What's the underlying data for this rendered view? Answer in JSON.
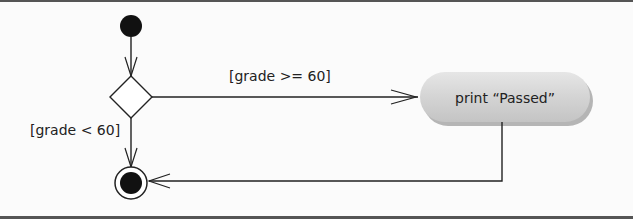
{
  "diagram": {
    "type": "uml-activity-diagram",
    "colors": {
      "frame": "#555555",
      "background": "#fbfbfb",
      "line": "#222222",
      "node_fill": "#111111",
      "action_fill": "#d6d6d6",
      "action_shadow": "#b5b5b5"
    },
    "nodes": {
      "initial": {
        "kind": "initial-node"
      },
      "decision": {
        "kind": "decision-node"
      },
      "action": {
        "kind": "action-state",
        "label": "print “Passed”"
      },
      "final": {
        "kind": "final-node"
      }
    },
    "guards": {
      "pass": "[grade >= 60]",
      "fail": "[grade < 60]"
    },
    "transitions": [
      {
        "from": "initial",
        "to": "decision",
        "guard": ""
      },
      {
        "from": "decision",
        "to": "action",
        "guard": "[grade >= 60]"
      },
      {
        "from": "decision",
        "to": "final",
        "guard": "[grade < 60]"
      },
      {
        "from": "action",
        "to": "final",
        "guard": ""
      }
    ]
  }
}
